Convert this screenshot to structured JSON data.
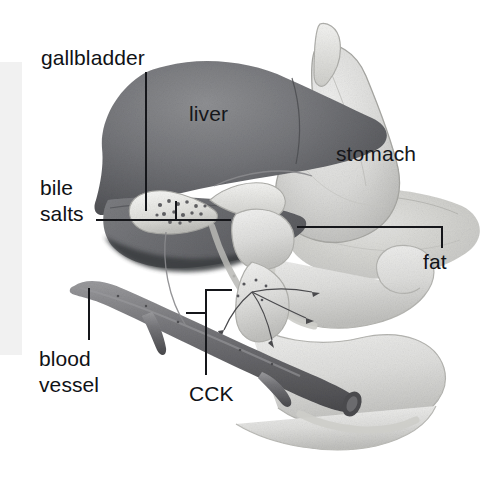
{
  "figure": {
    "background_color": "#ffffff",
    "width": 488,
    "height": 477
  },
  "scan_band": {
    "name": "left-edge-scan-band",
    "color": "#f1f1f1"
  },
  "labels": {
    "gallbladder": "gallbladder",
    "liver": "liver",
    "stomach": "stomach",
    "bile_salts_line1": "bile",
    "bile_salts_line2": "salts",
    "fat": "fat",
    "blood_vessel_line1": "blood",
    "blood_vessel_line2": "vessel",
    "cck": "CCK"
  },
  "structures": {
    "liver": {
      "label": "liver",
      "color": "#6f7074",
      "description": "large dark grey lobed organ upper left-centre"
    },
    "stomach": {
      "label": "stomach",
      "color": "#d8d9d8",
      "description": "pale grey J-shaped organ right of liver"
    },
    "gallbladder": {
      "label": "gallbladder",
      "color": "#e3e3e0",
      "description": "small pale sac beneath the liver, speckled with bile salt dots"
    },
    "bile_salts": {
      "label": "bile salts",
      "color": "#7a7a7a",
      "description": "dark speckles inside the gallbladder and bile duct"
    },
    "fat": {
      "label": "fat",
      "color": "#cbcbc7",
      "description": "mottled pale tissue below the stomach"
    },
    "blood_vessel": {
      "label": "blood vessel",
      "color": "#77777a",
      "description": "dark grey tube running diagonally across lower left to lower right"
    },
    "cck": {
      "label": "CCK",
      "color": "#5d5d60",
      "description": "cholecystokinin signalling arrows from duodenum wall"
    },
    "duodenum": {
      "label": "duodenum",
      "color": "#dedede",
      "description": "pale looping intestine occupying the lower right"
    }
  },
  "leaders": {
    "gallbladder": "vertical line from label down to gallbladder",
    "bile_salts": "horizontal line with upward riser into gallbladder",
    "fat": "horizontal line with downward drop to fat label",
    "blood_vessel": "vertical line from vessel down to label",
    "cck": "bracket from duodenum wall down to label"
  }
}
